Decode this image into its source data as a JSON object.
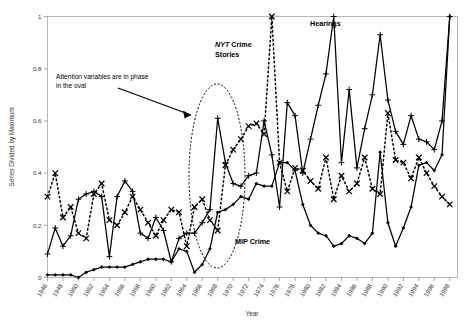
{
  "chart_data": {
    "type": "line",
    "title": "",
    "xlabel": "Year",
    "ylabel": "Series Divided by Maximum",
    "xlim": [
      1946,
      1999
    ],
    "ylim": [
      0,
      1
    ],
    "yticks": [
      "0",
      "0.2",
      "0.4",
      "0.6",
      "0.8",
      "1"
    ],
    "ytick_values": [
      0,
      0.2,
      0.4,
      0.6,
      0.8,
      1
    ],
    "grid": false,
    "legend_position": "inline-labels",
    "xticks": [
      "1946",
      "1948",
      "1950",
      "1952",
      "1954",
      "1956",
      "1958",
      "1960",
      "1962",
      "1964",
      "1966",
      "1968",
      "1970",
      "1972",
      "1974",
      "1976",
      "1978",
      "1980",
      "1982",
      "1984",
      "1986",
      "1988",
      "1990",
      "1992",
      "1994",
      "1996",
      "1998"
    ],
    "x": [
      1946,
      1947,
      1948,
      1949,
      1950,
      1951,
      1952,
      1953,
      1954,
      1955,
      1956,
      1957,
      1958,
      1959,
      1960,
      1961,
      1962,
      1963,
      1964,
      1965,
      1966,
      1967,
      1968,
      1969,
      1970,
      1971,
      1972,
      1973,
      1974,
      1975,
      1976,
      1977,
      1978,
      1979,
      1980,
      1981,
      1982,
      1983,
      1984,
      1985,
      1986,
      1987,
      1988,
      1989,
      1990,
      1991,
      1992,
      1993,
      1994,
      1995,
      1996,
      1997,
      1998
    ],
    "series": [
      {
        "name": "Hearings",
        "marker": "plus",
        "line": "solid",
        "values": [
          0.09,
          0.19,
          0.12,
          0.16,
          0.3,
          0.32,
          0.33,
          0.31,
          0.08,
          0.31,
          0.37,
          0.33,
          0.17,
          0.15,
          0.23,
          0.18,
          0.06,
          0.15,
          0.17,
          0.17,
          0.21,
          0.26,
          0.61,
          0.44,
          0.36,
          0.35,
          0.39,
          0.4,
          0.6,
          0.47,
          0.27,
          0.67,
          0.62,
          0.4,
          0.53,
          0.66,
          0.78,
          1.0,
          0.44,
          0.72,
          0.42,
          0.57,
          0.7,
          0.93,
          0.68,
          0.56,
          0.51,
          0.62,
          0.53,
          0.52,
          0.49,
          0.6,
          1.0
        ]
      },
      {
        "name": "NYT Crime Stories",
        "marker": "x",
        "line": "dotted",
        "values": [
          0.31,
          0.4,
          0.23,
          0.27,
          0.17,
          0.15,
          0.32,
          0.36,
          0.22,
          0.2,
          0.25,
          0.31,
          0.26,
          0.21,
          0.16,
          0.22,
          0.26,
          0.25,
          0.12,
          0.27,
          0.3,
          0.22,
          0.18,
          0.43,
          0.49,
          0.53,
          0.58,
          0.59,
          0.55,
          1.0,
          0.44,
          0.33,
          0.42,
          0.41,
          0.37,
          0.34,
          0.46,
          0.3,
          0.39,
          0.33,
          0.36,
          0.46,
          0.34,
          0.32,
          0.63,
          0.45,
          0.44,
          0.38,
          0.46,
          0.4,
          0.35,
          0.31,
          0.28
        ]
      },
      {
        "name": "MIP Crime",
        "marker": "diamond",
        "line": "solid",
        "values": [
          0.01,
          0.01,
          0.01,
          0.01,
          0.0,
          0.02,
          0.03,
          0.04,
          0.04,
          0.04,
          0.04,
          0.05,
          0.06,
          0.07,
          0.07,
          0.07,
          0.06,
          0.11,
          0.1,
          0.02,
          0.05,
          0.11,
          0.25,
          0.26,
          0.28,
          0.31,
          0.3,
          0.36,
          0.35,
          0.35,
          0.44,
          0.44,
          0.41,
          0.28,
          0.2,
          0.17,
          0.16,
          0.12,
          0.13,
          0.16,
          0.15,
          0.13,
          0.17,
          0.48,
          0.21,
          0.12,
          0.19,
          0.27,
          0.43,
          0.44,
          0.41,
          0.47,
          1.0
        ]
      }
    ],
    "annotations": [
      {
        "text_line1": "Attention variables are in phase",
        "text_line2": "in the oval",
        "name": "oval-annotation"
      },
      {
        "text": "Hearings",
        "name": "hearings-label"
      },
      {
        "text_italic": "NYT",
        "text_rest": " Crime",
        "text_line2": "Stories",
        "name": "nyt-crime-stories-label"
      },
      {
        "text": "MIP Crime",
        "name": "mip-crime-label"
      }
    ],
    "shapes": [
      {
        "type": "ellipse",
        "name": "phase-oval",
        "style": "dotted",
        "x_range": [
          1966,
          1974
        ]
      }
    ]
  }
}
